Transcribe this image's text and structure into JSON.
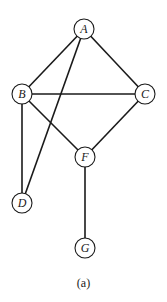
{
  "diagram": {
    "caption": "(a)",
    "nodes": [
      {
        "id": "A",
        "label": "A",
        "x": 84,
        "y": 29
      },
      {
        "id": "B",
        "label": "B",
        "x": 22,
        "y": 94
      },
      {
        "id": "C",
        "label": "C",
        "x": 145,
        "y": 94
      },
      {
        "id": "F",
        "label": "F",
        "x": 85,
        "y": 157
      },
      {
        "id": "D",
        "label": "D",
        "x": 22,
        "y": 203
      },
      {
        "id": "G",
        "label": "G",
        "x": 85,
        "y": 248
      }
    ],
    "edges": [
      [
        "A",
        "B"
      ],
      [
        "A",
        "C"
      ],
      [
        "A",
        "D"
      ],
      [
        "B",
        "C"
      ],
      [
        "B",
        "F"
      ],
      [
        "B",
        "D"
      ],
      [
        "C",
        "F"
      ],
      [
        "F",
        "G"
      ]
    ],
    "node_radius": 10,
    "colors": {
      "stroke": "#1a1a1a",
      "background": "#ffffff"
    }
  }
}
